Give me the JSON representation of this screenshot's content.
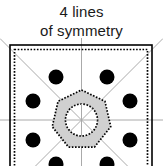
{
  "caption": {
    "line1": "4 lines",
    "line2": "of symmetry"
  },
  "figure": {
    "title_full": "4 lines of symmetry",
    "shape_name": "square-tile-pattern",
    "symmetry_line_count": 4,
    "colors": {
      "background": "#ffffff",
      "outline": "#000000",
      "dot_fill": "#000000",
      "polygon_fill": "#d0d0d0",
      "polygon_stroke": "#000000",
      "symmetry_line": "#aaaaaa",
      "text": "#1a1a1a"
    },
    "square": {
      "label": "outer-square-border",
      "x": 10,
      "y": 45,
      "width": 142,
      "height": 142,
      "stroke_width": 1.6
    },
    "inner_dotted_square": {
      "label": "inner-dotted-square-border",
      "x": 14.5,
      "y": 49.5,
      "width": 133,
      "height": 133,
      "dash": "1.6 1.6"
    },
    "center": {
      "cx": 81.5,
      "cy": 120
    },
    "symmetry_lines": [
      {
        "name": "vertical-symmetry-line",
        "x1": 81.5,
        "y1": 38,
        "x2": 81.5,
        "y2": 202
      },
      {
        "name": "horizontal-symmetry-line",
        "x1": 0,
        "y1": 120,
        "x2": 163,
        "y2": 120
      },
      {
        "name": "diagonal-symmetry-line-nwse",
        "x1": 0,
        "y1": 38.5,
        "x2": 163,
        "y2": 201.5
      },
      {
        "name": "diagonal-symmetry-line-nesw",
        "x1": 163,
        "y1": 38.5,
        "x2": 0,
        "y2": 201.5
      }
    ],
    "center_polygon": {
      "name": "center-heptagon",
      "sides": 7,
      "radius": 30,
      "rotation_deg": -90,
      "fill": "#d0d0d0",
      "dash": "1.6 1.6"
    },
    "center_circle": {
      "name": "center-circle",
      "radius": 16,
      "fill": "#ffffff",
      "dash": "1.6 1.6"
    },
    "dots": [
      {
        "name": "dot-top-left",
        "cx": 56,
        "cy": 77,
        "r": 7.5
      },
      {
        "name": "dot-top-right",
        "cx": 107,
        "cy": 77,
        "r": 7.5
      },
      {
        "name": "dot-upper-left",
        "cx": 33,
        "cy": 101,
        "r": 7.5
      },
      {
        "name": "dot-upper-right",
        "cx": 130,
        "cy": 101,
        "r": 7.5
      },
      {
        "name": "dot-lower-left",
        "cx": 33,
        "cy": 140,
        "r": 7.5
      },
      {
        "name": "dot-lower-right",
        "cx": 130,
        "cy": 140,
        "r": 7.5
      },
      {
        "name": "dot-bottom-left",
        "cx": 56,
        "cy": 164,
        "r": 7.5
      },
      {
        "name": "dot-bottom-right",
        "cx": 107,
        "cy": 164,
        "r": 7.5
      }
    ]
  }
}
